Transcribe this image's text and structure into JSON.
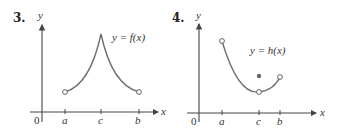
{
  "figures": [
    {
      "number": "3.",
      "function_label": "y = f(x)",
      "y_axis_label": "y",
      "x_axis_label": "x",
      "origin_label": "0",
      "ticks": [
        "a",
        "c",
        "b"
      ]
    },
    {
      "number": "4.",
      "function_label": "y = h(x)",
      "y_axis_label": "y",
      "x_axis_label": "x",
      "origin_label": "0",
      "ticks": [
        "a",
        "c",
        "b"
      ]
    }
  ],
  "colors": {
    "axis": "#444444",
    "curve": "#6e6e6e",
    "text": "#333333"
  }
}
